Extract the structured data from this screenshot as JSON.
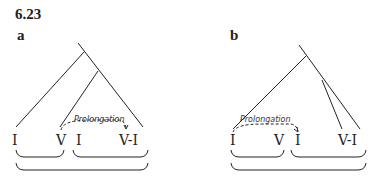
{
  "figure": {
    "number": "6.23",
    "panels": [
      {
        "label": "a",
        "chords": [
          "I",
          "V",
          "I",
          "V-I"
        ],
        "annotation": "Prolongation"
      },
      {
        "label": "b",
        "chords": [
          "I",
          "V",
          "I",
          "V-I"
        ],
        "annotation": "Prolongation"
      }
    ]
  }
}
